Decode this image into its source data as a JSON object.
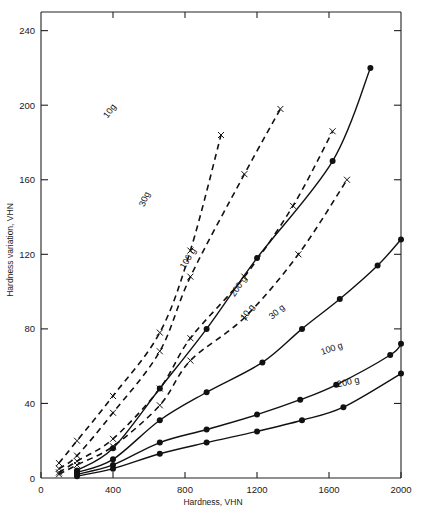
{
  "chart_data": {
    "type": "line",
    "title": "",
    "xlabel": "Hardness, VHN",
    "ylabel": "Hardness variation, VHN",
    "xlim": [
      0,
      2000
    ],
    "ylim": [
      0,
      250
    ],
    "xticks": [
      0,
      400,
      800,
      1200,
      1600,
      2000
    ],
    "xtick_labels": [
      "0",
      "400",
      "800",
      "1200",
      "1600",
      "2000"
    ],
    "yticks": [
      0,
      40,
      80,
      120,
      160,
      200,
      240
    ],
    "ytick_labels": [
      "0",
      "40",
      "80",
      "120",
      "160",
      "200",
      "240"
    ],
    "grid": false,
    "legend": "inline-curve-labels",
    "marker_styles": {
      "dashed": "x",
      "solid": "filled-circle"
    },
    "series": [
      {
        "name": "10 g (dashed)",
        "label": "10g",
        "line_style": "dashed",
        "marker": "x",
        "label_x": 395,
        "label_y": 196,
        "x": [
          100,
          200,
          400,
          660,
          830,
          1000
        ],
        "y": [
          8,
          20,
          44,
          78,
          122,
          184
        ]
      },
      {
        "name": "30 g (dashed)",
        "label": "30g",
        "line_style": "dashed",
        "marker": "x",
        "label_x": 590,
        "label_y": 149,
        "x": [
          100,
          200,
          400,
          660,
          830,
          1130,
          1330
        ],
        "y": [
          5,
          12,
          35,
          68,
          108,
          163,
          198
        ]
      },
      {
        "name": "100 g (dashed)",
        "label": "100 g",
        "line_style": "dashed",
        "marker": "x",
        "label_x": 830,
        "label_y": 117,
        "x": [
          100,
          200,
          400,
          660,
          830,
          1130,
          1400,
          1620
        ],
        "y": [
          3,
          9,
          21,
          48,
          75,
          108,
          146,
          186
        ]
      },
      {
        "name": "200 g (dashed)",
        "label": "200 g",
        "line_style": "dashed",
        "marker": "x",
        "label_x": 1110,
        "label_y": 102,
        "x": [
          100,
          200,
          400,
          660,
          830,
          1130,
          1430,
          1700
        ],
        "y": [
          2,
          7,
          17,
          39,
          63,
          86,
          120,
          160
        ]
      },
      {
        "name": "10 g (solid)",
        "label": "10 g",
        "line_style": "solid",
        "marker": "filled-circle",
        "label_x": 1160,
        "label_y": 88,
        "x": [
          200,
          400,
          660,
          920,
          1200,
          1620,
          1830
        ],
        "y": [
          4,
          16,
          48,
          80,
          118,
          170,
          220
        ]
      },
      {
        "name": "30 g (solid)",
        "label": "30 g",
        "line_style": "solid",
        "marker": "filled-circle",
        "label_x": 1320,
        "label_y": 88,
        "x": [
          200,
          400,
          660,
          920,
          1230,
          1450,
          1660,
          1870,
          2000
        ],
        "y": [
          3,
          10,
          31,
          46,
          62,
          80,
          96,
          114,
          128
        ]
      },
      {
        "name": "100 g (solid)",
        "label": "100 g",
        "line_style": "solid",
        "marker": "filled-circle",
        "label_x": 1620,
        "label_y": 68,
        "x": [
          200,
          400,
          660,
          920,
          1200,
          1440,
          1640,
          1940,
          2000
        ],
        "y": [
          2,
          7,
          19,
          26,
          34,
          42,
          50,
          66,
          72
        ]
      },
      {
        "name": "200 g (solid)",
        "label": "200 g",
        "line_style": "solid",
        "marker": "filled-circle",
        "label_x": 1710,
        "label_y": 50,
        "x": [
          200,
          400,
          660,
          920,
          1200,
          1450,
          1680,
          2000
        ],
        "y": [
          1,
          5,
          13,
          19,
          25,
          31,
          38,
          56
        ]
      }
    ]
  },
  "axes": {
    "x_title": "Hardness, VHN",
    "y_title": "Hardness variation, VHN"
  }
}
